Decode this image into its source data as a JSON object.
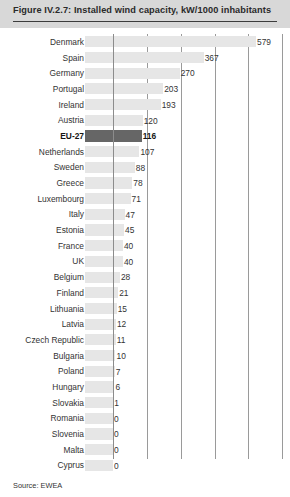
{
  "figure": {
    "title": "Figure IV.2.7: Installed wind capacity, kW/1000 inhabitants",
    "source": "Source: EWEA",
    "highlight_category": "EU-27",
    "colors": {
      "title_band": "#d8d8d8",
      "bar": "#e6e6e6",
      "bar_highlight": "#666666",
      "gridline": "#9a9a9a",
      "text": "#333333"
    }
  },
  "chart_data": {
    "type": "bar",
    "orientation": "horizontal",
    "title": "Figure IV.2.7: Installed wind capacity, kW/1000 inhabitants",
    "xlabel": "",
    "ylabel": "",
    "unit": "kW/1000 inhabitants",
    "xlim": [
      0,
      685
    ],
    "grid": true,
    "gridline_values": [
      0,
      137,
      274,
      411,
      548,
      685
    ],
    "legend": "none",
    "categories": [
      "Denmark",
      "Spain",
      "Germany",
      "Portugal",
      "Ireland",
      "Austria",
      "EU-27",
      "Netherlands",
      "Sweden",
      "Greece",
      "Luxembourg",
      "Italy",
      "Estonia",
      "France",
      "UK",
      "Belgium",
      "Finland",
      "Lithuania",
      "Latvia",
      "Czech Republic",
      "Bulgaria",
      "Poland",
      "Hungary",
      "Slovakia",
      "Romania",
      "Slovenia",
      "Malta",
      "Cyprus"
    ],
    "values": [
      579,
      367,
      270,
      203,
      193,
      120,
      116,
      107,
      88,
      78,
      71,
      47,
      45,
      40,
      40,
      28,
      21,
      15,
      12,
      11,
      10,
      7,
      6,
      1,
      0,
      0,
      0,
      0
    ],
    "labels": [
      "579",
      "367",
      "270",
      "203",
      "193",
      "120",
      "116",
      "107",
      "88",
      "78",
      "71",
      "47",
      "45",
      "40",
      "40",
      "28",
      "21",
      "15",
      "12",
      "11",
      "10",
      "7",
      "6",
      "1",
      "0",
      "0",
      "0",
      "0"
    ]
  }
}
